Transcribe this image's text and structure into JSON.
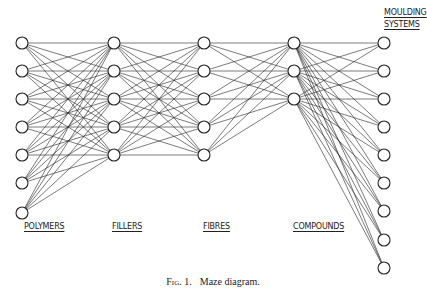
{
  "diagram": {
    "title": "Maze diagram",
    "caption": {
      "figure_label": "Fig. 1.",
      "text": "Maze diagram."
    },
    "layers": [
      {
        "id": "polymers",
        "label": "POLYMERS",
        "node_count": 7,
        "x": 22,
        "ys": [
          43,
          71,
          99,
          127,
          155,
          183,
          213
        ],
        "label_x": 24,
        "label_y": 222
      },
      {
        "id": "fillers",
        "label": "FILLERS",
        "node_count": 5,
        "x": 114,
        "ys": [
          43,
          71,
          99,
          127,
          155
        ],
        "label_x": 112,
        "label_y": 222
      },
      {
        "id": "fibres",
        "label": "FIBRES",
        "node_count": 5,
        "x": 204,
        "ys": [
          43,
          71,
          99,
          127,
          155
        ],
        "label_x": 203,
        "label_y": 222
      },
      {
        "id": "compounds",
        "label": "COMPOUNDS",
        "node_count": 3,
        "x": 294,
        "ys": [
          43,
          71,
          99
        ],
        "label_x": 293,
        "label_y": 222
      },
      {
        "id": "moulding_systems",
        "label": "MOULDING SYSTEMS",
        "label_lines": [
          "MOULDING",
          "SYSTEMS"
        ],
        "node_count": 9,
        "x": 384,
        "ys": [
          43,
          71,
          99,
          127,
          155,
          183,
          211,
          240,
          268
        ],
        "label_x": 384,
        "label_y": 8
      }
    ],
    "connections": "fully connected between each adjacent pair of layers",
    "node_radius": 6,
    "stroke_color": "#222222",
    "background": "#ffffff"
  }
}
